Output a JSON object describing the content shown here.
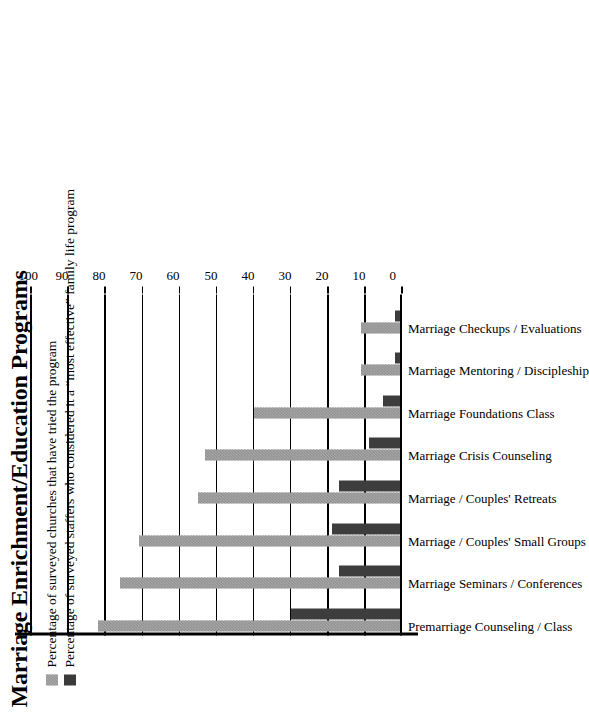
{
  "chart_data": {
    "type": "bar",
    "title": "Marriage Enrichment/Education Programs",
    "xlabel": "",
    "ylabel": "",
    "ylim": [
      0,
      100
    ],
    "yticks": [
      0,
      10,
      20,
      30,
      40,
      50,
      60,
      70,
      80,
      90,
      100
    ],
    "grid": true,
    "orientation": "vertical-rotated",
    "legend_position": "top-left",
    "categories": [
      "Premarriage Counseling / Class",
      "Marriage Seminars / Conferences",
      "Marriage / Couples' Small Groups",
      "Marriage / Couples' Retreats",
      "Marriage Crisis Counseling",
      "Marriage Foundations Class",
      "Marriage Mentoring / Discipleship",
      "Marriage Checkups / Evaluations"
    ],
    "series": [
      {
        "name": "Percentage of surveyed churches that have tried the program",
        "color": "#a5a5a5",
        "values": [
          82,
          76,
          71,
          55,
          53,
          40,
          11,
          11
        ]
      },
      {
        "name": "Percentage of surveyed staffers who considered it a “most effective” family life program",
        "color": "#3d3d3d",
        "values": [
          30,
          17,
          19,
          17,
          9,
          5,
          2,
          2
        ]
      }
    ]
  },
  "legend": {
    "items": [
      {
        "swatch": "light-hatched-swatch",
        "label": "Percentage of surveyed churches that have tried the program"
      },
      {
        "swatch": "dark-solid-swatch",
        "label": "Percentage of surveyed staffers who considered it a “most effective” family life program"
      }
    ]
  },
  "colors": {
    "series_a": "#a5a5a5",
    "series_b": "#3d3d3d",
    "axis": "#000000",
    "background": "#ffffff"
  }
}
